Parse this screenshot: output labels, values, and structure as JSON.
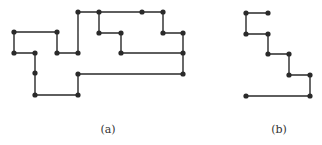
{
  "figures": [
    {
      "id": "a",
      "caption": "(a)",
      "caption_pos": [
        108,
        123
      ],
      "path": [
        [
          57,
          53
        ],
        [
          78,
          53
        ],
        [
          78,
          12
        ],
        [
          99,
          12
        ],
        [
          142,
          12
        ],
        [
          163,
          12
        ],
        [
          163,
          33
        ],
        [
          183,
          33
        ],
        [
          183,
          53
        ],
        [
          183,
          74
        ],
        [
          78,
          74
        ],
        [
          78,
          95
        ],
        [
          35,
          95
        ],
        [
          35,
          73
        ],
        [
          35,
          53
        ],
        [
          14,
          53
        ],
        [
          14,
          32
        ],
        [
          57,
          32
        ],
        [
          57,
          53
        ]
      ],
      "branch": [
        [
          99,
          12
        ],
        [
          99,
          33
        ],
        [
          121,
          33
        ],
        [
          121,
          53
        ],
        [
          183,
          53
        ]
      ],
      "nodes": [
        [
          14,
          32
        ],
        [
          57,
          32
        ],
        [
          14,
          53
        ],
        [
          35,
          53
        ],
        [
          57,
          53
        ],
        [
          78,
          53
        ],
        [
          78,
          12
        ],
        [
          99,
          12
        ],
        [
          142,
          12
        ],
        [
          163,
          12
        ],
        [
          99,
          33
        ],
        [
          121,
          33
        ],
        [
          163,
          33
        ],
        [
          183,
          33
        ],
        [
          121,
          53
        ],
        [
          183,
          53
        ],
        [
          78,
          74
        ],
        [
          183,
          74
        ],
        [
          35,
          73
        ],
        [
          35,
          95
        ],
        [
          78,
          95
        ]
      ]
    },
    {
      "id": "b",
      "caption": "(b)",
      "caption_pos": [
        279,
        123
      ],
      "path": [
        [
          268,
          13
        ],
        [
          246,
          13
        ],
        [
          246,
          34
        ],
        [
          268,
          34
        ],
        [
          268,
          54
        ],
        [
          289,
          54
        ],
        [
          289,
          75
        ],
        [
          310,
          75
        ],
        [
          310,
          96
        ],
        [
          246,
          96
        ]
      ],
      "branch": [],
      "nodes": [
        [
          246,
          13
        ],
        [
          268,
          13
        ],
        [
          246,
          34
        ],
        [
          268,
          34
        ],
        [
          268,
          54
        ],
        [
          289,
          54
        ],
        [
          289,
          75
        ],
        [
          310,
          75
        ],
        [
          310,
          96
        ],
        [
          246,
          96
        ]
      ]
    }
  ],
  "style": {
    "stroke": "#2a2a2a",
    "node_fill": "#2a2a2a",
    "node_radius": 2.6,
    "stroke_width": 1.4
  }
}
